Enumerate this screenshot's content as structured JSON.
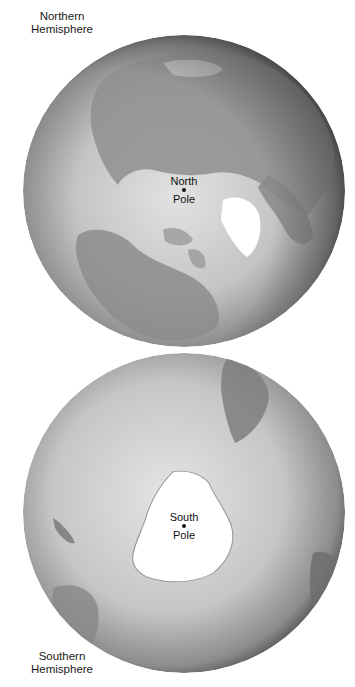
{
  "figure": {
    "northern": {
      "caption_line1": "Northern",
      "caption_line2": "Hemisphere",
      "pole_line1": "North",
      "pole_line2": "Pole"
    },
    "southern": {
      "caption_line1": "Southern",
      "caption_line2": "Hemisphere",
      "pole_line1": "South",
      "pole_line2": "Pole"
    },
    "colors": {
      "background": "#ffffff",
      "ocean_light": "#d9d9d9",
      "ocean_dark": "#3a3a3a",
      "land": "#8a8a8a",
      "ice": "#ffffff"
    }
  }
}
